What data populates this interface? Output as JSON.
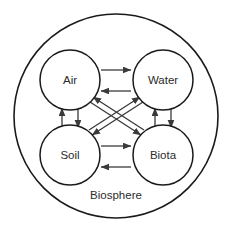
{
  "diagram": {
    "type": "cycle-diagram",
    "title": "Biosphere",
    "container": {
      "label": "Biosphere",
      "shape": "circle",
      "center": {
        "x": 116,
        "y": 116
      },
      "radius": 102,
      "stroke_color": "#1a1a1a",
      "fill_color": "#ffffff"
    },
    "nodes": [
      {
        "id": "air",
        "label": "Air",
        "cx": 70,
        "cy": 80,
        "r": 30
      },
      {
        "id": "water",
        "label": "Water",
        "cx": 163,
        "cy": 80,
        "r": 30
      },
      {
        "id": "soil",
        "label": "Soil",
        "cx": 70,
        "cy": 155,
        "r": 30
      },
      {
        "id": "biota",
        "label": "Biota",
        "cx": 163,
        "cy": 155,
        "r": 30
      }
    ],
    "edges": [
      {
        "id": "air-to-water",
        "from": "air",
        "to": "water",
        "direction": "right",
        "orientation": "horizontal"
      },
      {
        "id": "water-to-air",
        "from": "water",
        "to": "air",
        "direction": "left",
        "orientation": "horizontal"
      },
      {
        "id": "soil-to-biota",
        "from": "soil",
        "to": "biota",
        "direction": "right",
        "orientation": "horizontal"
      },
      {
        "id": "biota-to-soil",
        "from": "biota",
        "to": "soil",
        "direction": "left",
        "orientation": "horizontal"
      },
      {
        "id": "soil-to-air",
        "from": "soil",
        "to": "air",
        "direction": "up",
        "orientation": "vertical"
      },
      {
        "id": "air-to-soil",
        "from": "air",
        "to": "soil",
        "direction": "down",
        "orientation": "vertical"
      },
      {
        "id": "biota-to-water",
        "from": "biota",
        "to": "water",
        "direction": "up",
        "orientation": "vertical"
      },
      {
        "id": "water-to-biota",
        "from": "water",
        "to": "biota",
        "direction": "down",
        "orientation": "vertical"
      },
      {
        "id": "air-to-biota",
        "from": "air",
        "to": "biota",
        "direction": "down-right",
        "orientation": "diagonal"
      },
      {
        "id": "biota-to-air",
        "from": "biota",
        "to": "air",
        "direction": "up-left",
        "orientation": "diagonal"
      },
      {
        "id": "water-to-soil",
        "from": "water",
        "to": "soil",
        "direction": "down-left",
        "orientation": "diagonal"
      },
      {
        "id": "soil-to-water",
        "from": "soil",
        "to": "water",
        "direction": "up-right",
        "orientation": "diagonal"
      }
    ],
    "colors": {
      "stroke": "#1a1a1a",
      "arrow": "#3a3a3a",
      "text": "#2b2b2b",
      "background": "#ffffff"
    }
  }
}
